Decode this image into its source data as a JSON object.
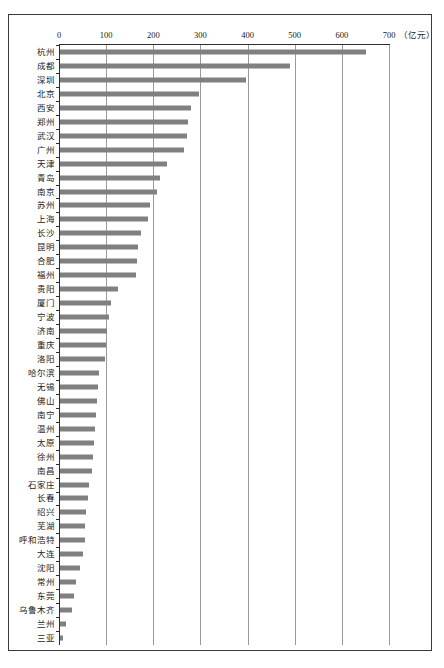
{
  "chart_data": {
    "type": "bar",
    "orientation": "horizontal",
    "title": "",
    "subtitle": "",
    "xlabel": "",
    "ylabel": "",
    "unit_label": "（亿元）",
    "xlim": [
      0,
      700
    ],
    "grid": true,
    "legend": null,
    "xticks": [
      0,
      100,
      200,
      300,
      400,
      500,
      600,
      700
    ],
    "xticklabels": [
      "0",
      "100",
      "200",
      "300",
      "400",
      "500",
      "600",
      "700"
    ],
    "bar_color": "#808080",
    "categories": [
      "杭州",
      "成都",
      "深圳",
      "北京",
      "西安",
      "郑州",
      "武汉",
      "广州",
      "天津",
      "青岛",
      "南京",
      "苏州",
      "上海",
      "长沙",
      "昆明",
      "合肥",
      "福州",
      "贵阳",
      "厦门",
      "宁波",
      "济南",
      "重庆",
      "洛阳",
      "哈尔滨",
      "无锡",
      "佛山",
      "南宁",
      "温州",
      "太原",
      "徐州",
      "南昌",
      "石家庄",
      "长春",
      "绍兴",
      "芜湖",
      "呼和浩特",
      "大连",
      "沈阳",
      "常州",
      "东莞",
      "乌鲁木齐",
      "兰州",
      "三亚"
    ],
    "values": [
      650,
      488,
      395,
      294,
      278,
      272,
      270,
      262,
      228,
      212,
      205,
      190,
      186,
      172,
      166,
      164,
      162,
      122,
      108,
      104,
      100,
      98,
      96,
      82,
      80,
      78,
      76,
      74,
      72,
      70,
      68,
      62,
      60,
      56,
      54,
      52,
      48,
      42,
      34,
      30,
      26,
      12,
      6
    ]
  },
  "axis": {
    "unit": "（亿元）"
  }
}
